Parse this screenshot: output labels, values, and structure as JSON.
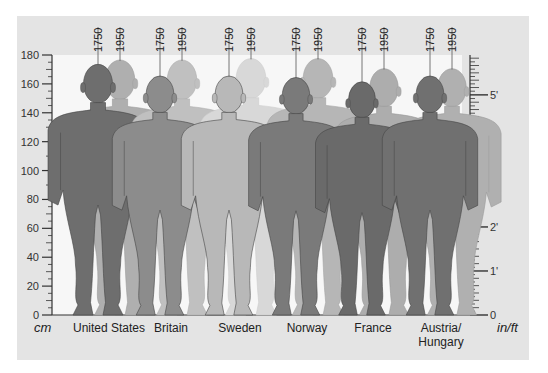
{
  "chart_data": {
    "type": "bar",
    "title": "",
    "xlabel": "",
    "ylabel": "cm",
    "ylabel_right": "in/ft",
    "ylim": [
      0,
      180
    ],
    "y_ticks_left": [
      0,
      20,
      40,
      60,
      80,
      100,
      120,
      140,
      160,
      180
    ],
    "y_ticks_right": [
      "0",
      "1'",
      "2'",
      "3'",
      "4'",
      "5'"
    ],
    "categories": [
      "United States",
      "Britain",
      "Sweden",
      "Norway",
      "France",
      "Austria/\nHungary"
    ],
    "series": [
      {
        "name": "1750",
        "values": [
          173,
          165,
          165,
          164,
          161,
          165
        ]
      },
      {
        "name": "1950",
        "values": [
          176,
          176,
          177,
          177,
          170,
          170
        ]
      }
    ],
    "grid": false,
    "legend": "year labels above each figure (1750, 1950)",
    "colors": {
      "United States": "#6e6e6e",
      "Britain": "#8c8c8c",
      "Sweden": "#b8b8b8",
      "Norway": "#7a7a7a",
      "France": "#6a6a6a",
      "Austria/Hungary": "#707070"
    }
  },
  "axis": {
    "left_unit": "cm",
    "right_unit": "in/ft",
    "left_ticks": [
      "0",
      "20",
      "40",
      "60",
      "80",
      "100",
      "120",
      "140",
      "160",
      "180"
    ],
    "right_ticks": [
      "0",
      "1'",
      "2'",
      "3'",
      "4'",
      "5'"
    ]
  },
  "year_labels": [
    "1750",
    "1950"
  ],
  "countries": [
    {
      "name": "United States",
      "line1": "United States",
      "line2": ""
    },
    {
      "name": "Britain",
      "line1": "Britain",
      "line2": ""
    },
    {
      "name": "Sweden",
      "line1": "Sweden",
      "line2": ""
    },
    {
      "name": "Norway",
      "line1": "Norway",
      "line2": ""
    },
    {
      "name": "France",
      "line1": "France",
      "line2": ""
    },
    {
      "name": "Austria/Hungary",
      "line1": "Austria/",
      "line2": "Hungary"
    }
  ]
}
